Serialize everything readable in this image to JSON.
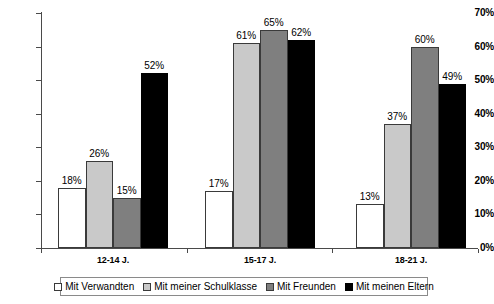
{
  "chart_data": {
    "type": "bar",
    "title": "",
    "xlabel": "",
    "ylabel": "",
    "ylim": [
      0,
      70
    ],
    "ytick_labels": [
      "0%",
      "10%",
      "20%",
      "30%",
      "40%",
      "50%",
      "60%",
      "70%"
    ],
    "ytick_values": [
      0,
      10,
      20,
      30,
      40,
      50,
      60,
      70
    ],
    "grid": false,
    "legend_position": "bottom",
    "value_suffix": "%",
    "categories": [
      "12-14 J.",
      "15-17 J.",
      "18-21 J."
    ],
    "series": [
      {
        "name": "Mit Verwandten",
        "color": "#ffffff",
        "values": [
          18,
          17,
          13
        ],
        "labels": [
          "18%",
          "17%",
          "13%"
        ]
      },
      {
        "name": "Mit meiner Schulklasse",
        "color": "#c9c9c9",
        "values": [
          26,
          61,
          37
        ],
        "labels": [
          "26%",
          "61%",
          "37%"
        ]
      },
      {
        "name": "Mit Freunden",
        "color": "#7f7f7f",
        "values": [
          15,
          65,
          60
        ],
        "labels": [
          "15%",
          "65%",
          "60%"
        ]
      },
      {
        "name": "Mit meinen Eltern",
        "color": "#000000",
        "values": [
          52,
          62,
          49
        ],
        "labels": [
          "52%",
          "62%",
          "49%"
        ]
      }
    ]
  },
  "legend": {
    "items": [
      {
        "label": "Mit Verwandten"
      },
      {
        "label": "Mit meiner Schulklasse"
      },
      {
        "label": "Mit Freunden"
      },
      {
        "label": "Mit meinen Eltern"
      }
    ]
  }
}
